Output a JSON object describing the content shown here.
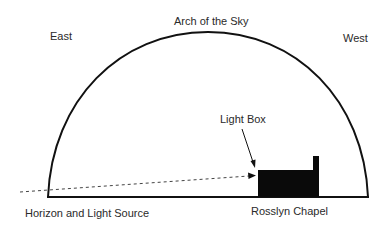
{
  "labels": {
    "arch": "Arch of the Sky",
    "east": "East",
    "west": "West",
    "light_box": "Light Box",
    "horizon": "Horizon and Light Source",
    "chapel": "Rosslyn Chapel"
  },
  "colors": {
    "line": "#111111",
    "text": "#2a2a2a",
    "background": "#ffffff"
  }
}
